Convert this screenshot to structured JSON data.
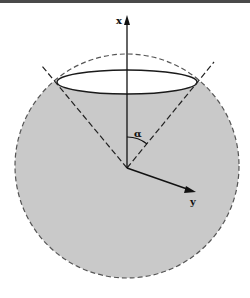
{
  "diagram": {
    "type": "cone-in-sphere",
    "labels": {
      "x_axis": "x",
      "y_axis": "y",
      "angle": "α"
    },
    "colors": {
      "sphere_fill": "#c8c8c8",
      "sphere_outline": "#555555",
      "lines": "#1a1a1a",
      "background": "#ffffff"
    }
  }
}
